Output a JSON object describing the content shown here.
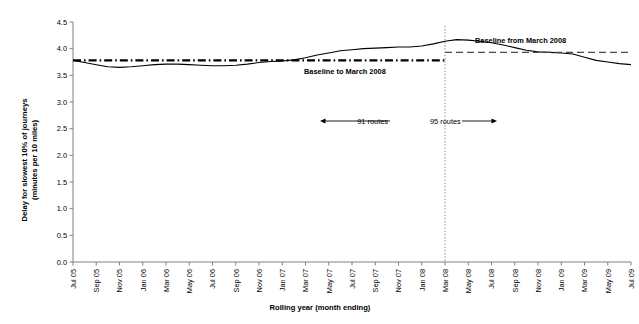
{
  "chart_data": {
    "type": "line",
    "title": "",
    "xlabel": "Rolling year (month ending)",
    "ylabel": "Delay for slowest 10% of journeys (minutes per 10 miles)",
    "ylim": [
      0.0,
      4.5
    ],
    "ytick_labels": [
      "0.0",
      "0.5",
      "1.0",
      "1.5",
      "2.0",
      "2.5",
      "3.0",
      "3.5",
      "4.0",
      "4.5"
    ],
    "ytick_values": [
      0.0,
      0.5,
      1.0,
      1.5,
      2.0,
      2.5,
      3.0,
      3.5,
      4.0,
      4.5
    ],
    "grid": false,
    "legend": "none",
    "categories": [
      "Jul 05",
      "Aug 05",
      "Sep 05",
      "Oct 05",
      "Nov 05",
      "Dec 05",
      "Jan 06",
      "Feb 06",
      "Mar 06",
      "Apr 06",
      "May 06",
      "Jun 06",
      "Jul 06",
      "Aug 06",
      "Sep 06",
      "Oct 06",
      "Nov 06",
      "Dec 06",
      "Jan 07",
      "Feb 07",
      "Mar 07",
      "Apr 07",
      "May 07",
      "Jun 07",
      "Jul 07",
      "Aug 07",
      "Sep 07",
      "Oct 07",
      "Nov 07",
      "Dec 07",
      "Jan 08",
      "Feb 08",
      "Mar 08",
      "Apr 08",
      "May 08",
      "Jun 08",
      "Jul 08",
      "Aug 08",
      "Sep 08",
      "Oct 08",
      "Nov 08",
      "Dec 08",
      "Jan 09",
      "Feb 09",
      "Mar 09",
      "Apr 09",
      "May 09",
      "Jun 09",
      "Jul 09"
    ],
    "xtick_labels": [
      "Jul 05",
      "Sep 05",
      "Nov 05",
      "Jan 06",
      "Mar 06",
      "May 06",
      "Jul 06",
      "Sep 06",
      "Nov 06",
      "Jan 07",
      "Mar 07",
      "May 07",
      "Jul 07",
      "Sep 07",
      "Nov 07",
      "Jan 08",
      "Mar 08",
      "May 08",
      "Jul 08",
      "Sep 08",
      "Nov 08",
      "Jan 09",
      "Mar 09",
      "May 09",
      "Jul 09"
    ],
    "series": [
      {
        "name": "Delay for slowest 10% of journeys",
        "style": "solid",
        "values": [
          3.78,
          3.74,
          3.7,
          3.66,
          3.65,
          3.66,
          3.68,
          3.7,
          3.71,
          3.71,
          3.7,
          3.69,
          3.68,
          3.68,
          3.69,
          3.71,
          3.74,
          3.76,
          3.77,
          3.79,
          3.83,
          3.88,
          3.92,
          3.96,
          3.98,
          4.0,
          4.01,
          4.02,
          4.03,
          4.03,
          4.05,
          4.09,
          4.14,
          4.17,
          4.16,
          4.14,
          4.11,
          4.07,
          4.02,
          3.97,
          3.94,
          3.93,
          3.92,
          3.9,
          3.84,
          3.78,
          3.75,
          3.72,
          3.7
        ]
      },
      {
        "name": "Baseline to March 2008",
        "style": "dash-dot",
        "start_category": "Jul 05",
        "end_category": "Mar 08",
        "value": 3.78
      },
      {
        "name": "Baseline from March 2008",
        "style": "dashed",
        "start_category": "Mar 08",
        "end_category": "Jul 09",
        "value": 3.93
      }
    ],
    "annotations": [
      {
        "name": "baseline-to-label",
        "text": "Baseline to March 2008"
      },
      {
        "name": "baseline-from-label",
        "text": "Baseline from March 2008"
      },
      {
        "name": "routes-left-label",
        "text": "91 routes"
      },
      {
        "name": "routes-right-label",
        "text": "95 routes"
      },
      {
        "name": "divider-line",
        "text": "Mar 08"
      }
    ]
  },
  "axis": {
    "x_title": "Rolling year (month ending)",
    "y_title_line1": "Delay for slowest 10% of journeys",
    "y_title_line2": "(minutes per 10 miles)"
  },
  "colors": {
    "line": "#000000",
    "axis": "#808080",
    "background": "#ffffff",
    "divider": "#999999"
  }
}
